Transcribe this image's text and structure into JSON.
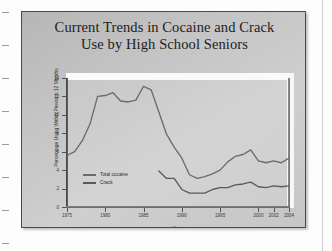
{
  "slide": {
    "title_line1": "Current Trends in Cocaine and Crack",
    "title_line2": "Use by High School Seniors"
  },
  "legend": {
    "series1": "Total cocaine",
    "series2": "Crack"
  },
  "axis": {
    "x_title": "Year",
    "y_title": "Percentage Using Within Previous 12 Months"
  },
  "colors": {
    "slide_background": "#c4c4c4",
    "slide_border": "#4a4a4a",
    "title_text": "#201d1c",
    "series1_line": "#6b6b6b",
    "series2_line": "#5a5a5a",
    "axis": "#4a4a4a",
    "page_background": "#fdfdfd"
  },
  "chart_data": {
    "type": "line",
    "title": "Current Trends in Cocaine and Crack Use by High School Seniors",
    "xlabel": "Year",
    "ylabel": "Percentage Using Within Previous 12 Months",
    "xlim": [
      1975,
      2004
    ],
    "ylim": [
      0,
      14
    ],
    "yticks": [
      0,
      2,
      4,
      6,
      8,
      10,
      12,
      14
    ],
    "xticks": [
      1975,
      1980,
      1985,
      1990,
      1995,
      2000,
      2002,
      2004
    ],
    "xtick_labels": [
      "1975",
      "1980",
      "1985",
      "1990",
      "1995",
      "2000",
      "2002",
      "2004"
    ],
    "ytick_labels": [
      "0",
      "2",
      "4",
      "6",
      "8",
      "10",
      "12",
      "14"
    ],
    "grid": false,
    "legend_position": "lower-left-inside",
    "series": [
      {
        "name": "Total cocaine",
        "x": [
          1975,
          1976,
          1977,
          1978,
          1979,
          1980,
          1981,
          1982,
          1983,
          1984,
          1985,
          1986,
          1987,
          1988,
          1989,
          1990,
          1991,
          1992,
          1993,
          1994,
          1995,
          1996,
          1997,
          1998,
          1999,
          2000,
          2001,
          2002,
          2003,
          2004
        ],
        "values": [
          5.6,
          6.0,
          7.2,
          9.0,
          12.0,
          12.1,
          12.4,
          11.5,
          11.4,
          11.6,
          13.1,
          12.7,
          10.3,
          7.9,
          6.5,
          5.3,
          3.5,
          3.1,
          3.3,
          3.6,
          4.0,
          4.9,
          5.5,
          5.7,
          6.2,
          5.0,
          4.8,
          5.0,
          4.8,
          5.3
        ]
      },
      {
        "name": "Crack",
        "x": [
          1987,
          1988,
          1989,
          1990,
          1991,
          1992,
          1993,
          1994,
          1995,
          1996,
          1997,
          1998,
          1999,
          2000,
          2001,
          2002,
          2003,
          2004
        ],
        "values": [
          3.9,
          3.1,
          3.1,
          1.9,
          1.5,
          1.5,
          1.5,
          1.9,
          2.1,
          2.1,
          2.4,
          2.5,
          2.7,
          2.2,
          2.1,
          2.3,
          2.2,
          2.3
        ]
      }
    ]
  },
  "margin_marks": {
    "count": 8
  }
}
